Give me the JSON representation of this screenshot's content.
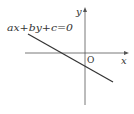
{
  "diagram": {
    "equation_label": "ax+by+c=0",
    "x_axis_label": "x",
    "y_axis_label": "y",
    "origin_label": "O",
    "colors": {
      "axis": "#555555",
      "line": "#333333",
      "text": "#333333",
      "background": "#ffffff"
    }
  }
}
